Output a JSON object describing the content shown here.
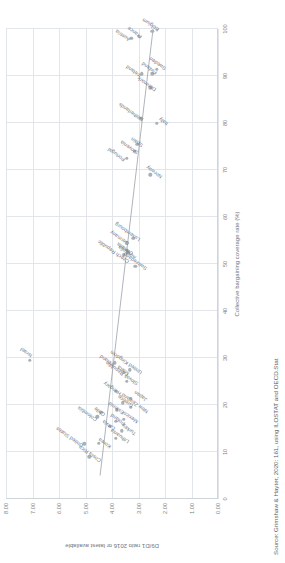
{
  "figure": {
    "source_note": "Source: Grimshaw & Hayter, 2020: 161, using ILOSTAT and OECD.Stat"
  },
  "chart_data": {
    "type": "scatter",
    "title": "",
    "xlabel": "Collective bargaining coverage rate (%)",
    "ylabel": "D9/D1 ratio 2016 or latest available",
    "xlim": [
      0,
      100
    ],
    "ylim": [
      0,
      8
    ],
    "xticks": [
      "0",
      "10",
      "20",
      "30",
      "40",
      "50",
      "60",
      "70",
      "80",
      "90",
      "100"
    ],
    "yticks": [
      "0.00",
      "1.00",
      "2.00",
      "3.00",
      "4.00",
      "5.00",
      "6.00",
      "7.00",
      "8.00"
    ],
    "grid": true,
    "legend": "none",
    "trendline": {
      "x0": 5.0,
      "y0": 4.45,
      "x1": 100.0,
      "y1": 2.45
    },
    "points": [
      {
        "label": "Costa Rica",
        "x": 9.0,
        "y": 4.86,
        "lx": -4,
        "ly": 9,
        "rot": -55
      },
      {
        "label": "United States",
        "x": 11.8,
        "y": 5.05,
        "lx": -2,
        "ly": -4,
        "rot": -55
      },
      {
        "label": "Korea",
        "x": 11.9,
        "y": 4.5,
        "lx": -4,
        "ly": 9,
        "rot": -55
      },
      {
        "label": "Lithuania",
        "x": 13.0,
        "y": 3.85,
        "lx": -4,
        "ly": 10,
        "rot": -55
      },
      {
        "label": "Turkey",
        "x": 14.5,
        "y": 3.64,
        "lx": -3,
        "ly": 11,
        "rot": -55
      },
      {
        "label": "Latvia",
        "x": 15.5,
        "y": 4.08,
        "lx": -3,
        "ly": 2,
        "rot": -55
      },
      {
        "label": "Poland",
        "x": 16.5,
        "y": 3.86,
        "lx": -3,
        "ly": 6,
        "rot": -55
      },
      {
        "label": "Mexico",
        "x": 17.0,
        "y": 3.55,
        "lx": -3,
        "ly": 11,
        "rot": -55
      },
      {
        "label": "Colombia",
        "x": 17.5,
        "y": 4.55,
        "lx": -3,
        "ly": -3,
        "rot": -55
      },
      {
        "label": "Chile",
        "x": 18.5,
        "y": 4.4,
        "lx": -3,
        "ly": 1,
        "rot": -55
      },
      {
        "label": "Estonia",
        "x": 19.0,
        "y": 3.81,
        "lx": -3,
        "ly": 4,
        "rot": -55
      },
      {
        "label": "New Zealand",
        "x": 19.5,
        "y": 3.3,
        "lx": -5,
        "ly": 14,
        "rot": -55
      },
      {
        "label": "Greece",
        "x": 20.5,
        "y": 3.6,
        "lx": -3,
        "ly": 7,
        "rot": -55
      },
      {
        "label": "Japan",
        "x": 21.5,
        "y": 3.3,
        "lx": -2,
        "ly": 13,
        "rot": -55
      },
      {
        "label": "Hungary",
        "x": 23.0,
        "y": 3.85,
        "lx": -3,
        "ly": 2,
        "rot": -55
      },
      {
        "label": "Slovak Republic",
        "x": 25.0,
        "y": 3.45,
        "lx": -3,
        "ly": 8,
        "rot": -55
      },
      {
        "label": "Malta",
        "x": 27.0,
        "y": 3.55,
        "lx": -2,
        "ly": 2,
        "rot": -55
      },
      {
        "label": "United Kingdom",
        "x": 27.5,
        "y": 3.32,
        "lx": -3,
        "ly": 9,
        "rot": -55
      },
      {
        "label": "Ireland",
        "x": 29.0,
        "y": 3.9,
        "lx": -2,
        "ly": -4,
        "rot": -55
      },
      {
        "label": "Israel",
        "x": 29.5,
        "y": 7.1,
        "lx": 4,
        "ly": -1,
        "rot": -55
      },
      {
        "label": "Switzerland",
        "x": 49.5,
        "y": 3.12,
        "lx": -3,
        "ly": 9,
        "rot": -55
      },
      {
        "label": "Czech Republic",
        "x": 52.0,
        "y": 3.55,
        "lx": -7,
        "ly": 2,
        "rot": -55
      },
      {
        "label": "Australia",
        "x": 52.5,
        "y": 3.38,
        "lx": -6,
        "ly": 5,
        "rot": -55
      },
      {
        "label": "Canada",
        "x": 53.0,
        "y": 3.45,
        "lx": -4,
        "ly": 3,
        "rot": -55
      },
      {
        "label": "Germany",
        "x": 54.5,
        "y": 3.45,
        "lx": -1,
        "ly": -1,
        "rot": -55
      },
      {
        "label": "Luxembourg",
        "x": 55.5,
        "y": 3.2,
        "lx": -2,
        "ly": 4,
        "rot": -55
      },
      {
        "label": "Norway",
        "x": 69.0,
        "y": 2.56,
        "lx": -2,
        "ly": 9,
        "rot": -55
      },
      {
        "label": "Portugal",
        "x": 72.5,
        "y": 3.45,
        "lx": -2,
        "ly": -5,
        "rot": -55
      },
      {
        "label": "Slovenia",
        "x": 74.0,
        "y": 3.15,
        "lx": -2,
        "ly": 0,
        "rot": -55
      },
      {
        "label": "Spain",
        "x": 75.5,
        "y": 3.05,
        "lx": -2,
        "ly": 3,
        "rot": -55
      },
      {
        "label": "Italy",
        "x": 80.0,
        "y": 2.32,
        "lx": -1,
        "ly": 8,
        "rot": -55
      },
      {
        "label": "Netherlands",
        "x": 81.0,
        "y": 2.9,
        "lx": -2,
        "ly": -1,
        "rot": -55
      },
      {
        "label": "Denmark",
        "x": 87.5,
        "y": 2.55,
        "lx": -2,
        "ly": 3,
        "rot": -55
      },
      {
        "label": "Iceland",
        "x": 90.5,
        "y": 2.88,
        "lx": -2,
        "ly": -4,
        "rot": -55
      },
      {
        "label": "Finland",
        "x": 90.5,
        "y": 2.48,
        "lx": 1,
        "ly": 2,
        "rot": -55
      },
      {
        "label": "Sweden",
        "x": 91.5,
        "y": 2.3,
        "lx": 0,
        "ly": 6,
        "rot": -55
      },
      {
        "label": "Austria",
        "x": 98.0,
        "y": 3.27,
        "lx": -2,
        "ly": -4,
        "rot": -55
      },
      {
        "label": "France",
        "x": 98.5,
        "y": 3.0,
        "lx": -1,
        "ly": 0,
        "rot": -55
      },
      {
        "label": "Belgium",
        "x": 99.5,
        "y": 2.48,
        "lx": 1,
        "ly": 4,
        "rot": -55
      }
    ]
  }
}
